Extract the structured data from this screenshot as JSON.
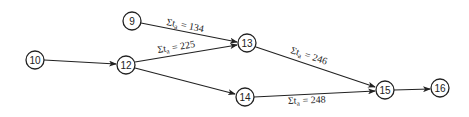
{
  "diagram": {
    "type": "network-path-diagram",
    "nodes": [
      {
        "id": "9",
        "label": "9",
        "x": 132,
        "y": 21
      },
      {
        "id": "10",
        "label": "10",
        "x": 35,
        "y": 60
      },
      {
        "id": "12",
        "label": "12",
        "x": 126,
        "y": 65
      },
      {
        "id": "13",
        "label": "13",
        "x": 247,
        "y": 43
      },
      {
        "id": "14",
        "label": "14",
        "x": 245,
        "y": 97
      },
      {
        "id": "15",
        "label": "15",
        "x": 385,
        "y": 90
      },
      {
        "id": "16",
        "label": "16",
        "x": 440,
        "y": 88
      }
    ],
    "edges": [
      {
        "from": "9",
        "to": "13",
        "label": "Σt",
        "sub": "a",
        "value": "= 134"
      },
      {
        "from": "12",
        "to": "13",
        "label": "Σt",
        "sub": "a",
        "value": "= 225"
      },
      {
        "from": "10",
        "to": "12",
        "label": "",
        "sub": "",
        "value": ""
      },
      {
        "from": "12",
        "to": "14",
        "label": "",
        "sub": "",
        "value": ""
      },
      {
        "from": "13",
        "to": "15",
        "label": "Σt",
        "sub": "a",
        "value": "= 246"
      },
      {
        "from": "14",
        "to": "15",
        "label": "Σt",
        "sub": "a",
        "value": "= 248"
      },
      {
        "from": "15",
        "to": "16",
        "label": "",
        "sub": "",
        "value": ""
      }
    ]
  }
}
